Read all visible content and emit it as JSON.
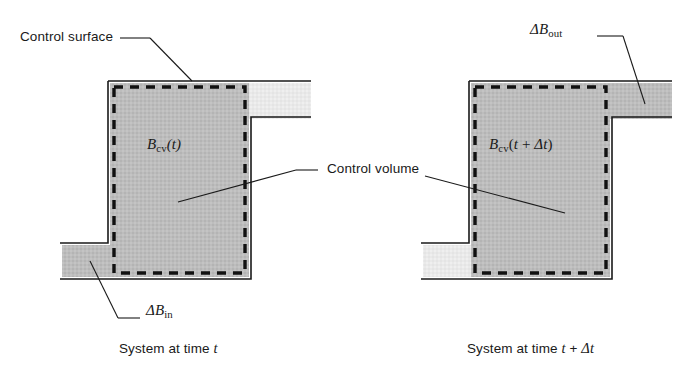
{
  "figure": {
    "title_absent": true,
    "background_color": "#ffffff",
    "line_color": "#1a1a1a",
    "fill_dark_gray": "#bcbcbc",
    "fill_light_gray": "#e9e9e9"
  },
  "annotations": {
    "control_surface": "Control surface",
    "control_volume": "Control volume",
    "delta_b_in_symbol": "ΔB",
    "delta_b_in_subscript": "in",
    "delta_b_out_symbol": "ΔB",
    "delta_b_out_subscript": "out"
  },
  "left_panel": {
    "cv_symbol": "B",
    "cv_subscript": "cv",
    "cv_argument": "(t)",
    "caption_prefix": "System at time ",
    "caption_variable": "t"
  },
  "right_panel": {
    "cv_symbol": "B",
    "cv_subscript": "cv",
    "cv_argument_open": "(",
    "cv_argument_t": "t",
    "cv_argument_plus": " + ",
    "cv_argument_delta": "Δt",
    "cv_argument_close": ")",
    "caption_prefix": "System at time ",
    "caption_variable": "t",
    "caption_plus": " + ",
    "caption_delta": "Δt"
  }
}
